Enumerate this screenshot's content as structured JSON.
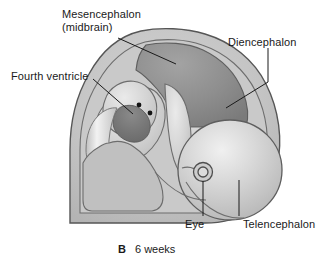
{
  "figure": {
    "caption_letter": "B",
    "caption_text": "6 weeks"
  },
  "labels": {
    "mesencephalon_line1": "Mesencephalon",
    "mesencephalon_line2": "(midbrain)",
    "fourth_ventricle": "Fourth ventricle",
    "diencephalon": "Diencephalon",
    "eye": "Eye",
    "telencephalon": "Telencephalon"
  },
  "colors": {
    "background": "#ffffff",
    "outline": "#4a4a4a",
    "leader_line": "#1a1a1a",
    "head_fill": "#c4c4c4",
    "brain_body_fill": "#bdbdbd",
    "midbrain_dark": "#8e8e8e",
    "fourth_ventricle_dark": "#7c7c7c",
    "telencephalon_fill": "#c9c9c9",
    "telencephalon_highlight": "#ededed",
    "hindbrain_fill": "#c2c2c2",
    "text": "#1a1a1a",
    "dot": "#111111"
  }
}
